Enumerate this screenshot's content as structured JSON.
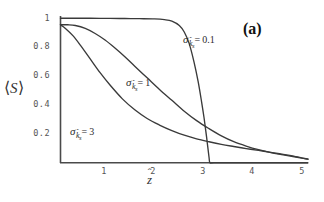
{
  "figure": {
    "panel_label": "(a)",
    "background_color": "#ffffff",
    "line_color": "#3a3a3a",
    "axis_color": "#4a4a4a",
    "tick_text_color": "#555555"
  },
  "axes": {
    "y_title_prefix": "⟨",
    "y_title_symbol": "S",
    "y_title_suffix": "⟩",
    "x_title_symbol": "z",
    "x_title_hat": "ˆ",
    "y_ticks": [
      "1",
      "0.8",
      "0.6",
      "0.4",
      "0.2"
    ],
    "y_tick_values": [
      1,
      0.8,
      0.6,
      0.4,
      0.2
    ],
    "x_ticks": [
      "1",
      "2",
      "3",
      "4",
      "5"
    ],
    "x_tick_values": [
      1,
      2,
      3,
      4,
      5
    ]
  },
  "curve_labels": [
    {
      "id": "sigma-0-1",
      "sigma": "σ",
      "sub_symbol": "k",
      "sub_hat": "ˆ",
      "sub_sub": "s",
      "equals": "=",
      "value": "0.1"
    },
    {
      "id": "sigma-1",
      "sigma": "σ",
      "sub_symbol": "k",
      "sub_hat": "ˆ",
      "sub_sub": "s",
      "equals": "=",
      "value": "1"
    },
    {
      "id": "sigma-3",
      "sigma": "σ",
      "sub_symbol": "k",
      "sub_hat": "ˆ",
      "sub_sub": "s",
      "equals": "=",
      "value": "3"
    }
  ],
  "chart_data": {
    "type": "line",
    "title": "(a)",
    "xlabel": "ẑ",
    "ylabel": "⟨S⟩",
    "xlim": [
      0,
      5
    ],
    "ylim": [
      0,
      1
    ],
    "grid": false,
    "legend": "inline-annotations",
    "series": [
      {
        "name": "σ_k̂s = 0.1",
        "x": [
          0,
          0.2,
          0.5,
          0.8,
          1.0,
          1.3,
          1.6,
          1.9,
          2.1,
          2.25,
          2.4,
          2.5,
          2.6,
          2.7,
          2.78,
          2.85,
          2.9,
          2.95,
          3.0,
          3.02,
          3.1,
          3.5,
          4.0,
          4.5,
          5.0
        ],
        "y": [
          0.995,
          0.995,
          0.995,
          0.994,
          0.994,
          0.993,
          0.992,
          0.99,
          0.985,
          0.975,
          0.945,
          0.9,
          0.82,
          0.69,
          0.56,
          0.42,
          0.31,
          0.18,
          0.04,
          0.0,
          0.0,
          0.0,
          0.0,
          0.0,
          0.0
        ]
      },
      {
        "name": "σ_k̂s = 1",
        "x": [
          0,
          0.15,
          0.3,
          0.5,
          0.7,
          0.9,
          1.1,
          1.3,
          1.5,
          1.75,
          2.0,
          2.25,
          2.5,
          2.75,
          3.0,
          3.25,
          3.5,
          3.75,
          4.0,
          4.25,
          4.5,
          4.75,
          5.0
        ],
        "y": [
          0.95,
          0.95,
          0.945,
          0.925,
          0.89,
          0.845,
          0.79,
          0.73,
          0.665,
          0.585,
          0.505,
          0.43,
          0.355,
          0.29,
          0.235,
          0.185,
          0.145,
          0.115,
          0.09,
          0.07,
          0.055,
          0.04,
          0.025
        ]
      },
      {
        "name": "σ_k̂s = 3",
        "x": [
          0,
          0.1,
          0.25,
          0.4,
          0.6,
          0.8,
          1.0,
          1.25,
          1.5,
          1.75,
          2.0,
          2.25,
          2.5,
          2.75,
          3.0,
          3.25,
          3.5,
          3.75,
          4.0,
          4.25,
          4.5,
          4.75,
          5.0
        ],
        "y": [
          0.95,
          0.925,
          0.875,
          0.81,
          0.715,
          0.62,
          0.535,
          0.44,
          0.365,
          0.305,
          0.26,
          0.222,
          0.19,
          0.165,
          0.145,
          0.127,
          0.112,
          0.098,
          0.085,
          0.072,
          0.058,
          0.043,
          0.025
        ]
      }
    ]
  }
}
